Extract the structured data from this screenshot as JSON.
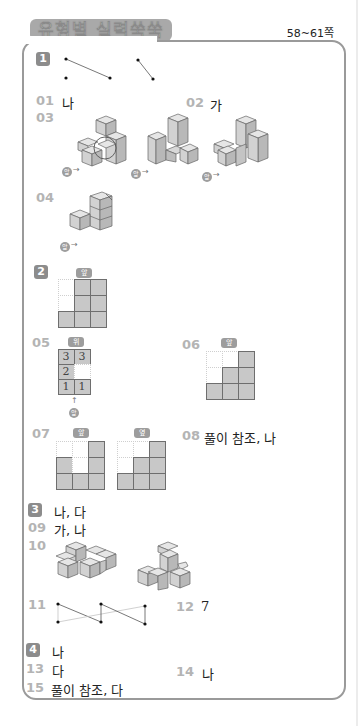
{
  "header": {
    "title": "유형별 실력쑥쑥",
    "page_range": "58~61쪽"
  },
  "sections": [
    {
      "badge": "1"
    },
    {
      "badge": "2",
      "view_label": "앞"
    },
    {
      "badge": "3",
      "answer": "나, 다"
    },
    {
      "badge": "4",
      "answer": "나"
    }
  ],
  "questions": {
    "q01": {
      "num": "01",
      "answer": "나"
    },
    "q02": {
      "num": "02",
      "answer": "가"
    },
    "q03": {
      "num": "03",
      "front_label": "앞"
    },
    "q04": {
      "num": "04",
      "front_label": "앞"
    },
    "q05": {
      "num": "05",
      "top_label": "위",
      "front_label": "앞",
      "grid": [
        [
          "3",
          "3"
        ],
        [
          "2",
          ""
        ],
        [
          "1",
          "1"
        ]
      ]
    },
    "q06": {
      "num": "06",
      "view_label": "앞"
    },
    "q07": {
      "num": "07",
      "front_label": "앞",
      "side_label": "옆"
    },
    "q08": {
      "num": "08",
      "answer": "풀이 참조, 나"
    },
    "q09": {
      "num": "09",
      "answer": "가, 나"
    },
    "q10": {
      "num": "10"
    },
    "q11": {
      "num": "11"
    },
    "q12": {
      "num": "12",
      "answer": "7"
    },
    "q13": {
      "num": "13",
      "answer": "다"
    },
    "q14": {
      "num": "14",
      "answer": "나"
    },
    "q15": {
      "num": "15",
      "answer": "풀이 참조, 다"
    }
  },
  "grids": {
    "sec2_front": [
      [
        0,
        1,
        1
      ],
      [
        0,
        1,
        1
      ],
      [
        1,
        1,
        1
      ]
    ],
    "q06_front": [
      [
        0,
        0,
        1
      ],
      [
        0,
        1,
        1
      ],
      [
        1,
        1,
        1
      ]
    ],
    "q07_front": [
      [
        0,
        0,
        1
      ],
      [
        1,
        0,
        1
      ],
      [
        1,
        1,
        1
      ]
    ],
    "q07_side": [
      [
        0,
        0,
        1
      ],
      [
        0,
        1,
        1
      ],
      [
        1,
        1,
        1
      ]
    ]
  },
  "colors": {
    "badge": "#8c8c8c",
    "qnum": "#b4b4b4",
    "cell_fill": "#c8c8c8",
    "frame": "#9a9a9a"
  }
}
